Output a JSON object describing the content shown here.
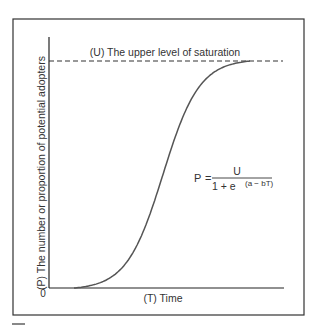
{
  "diagram": {
    "saturation_label": "(U) The upper level of saturation",
    "y_axis_label": "(P) The number or proportion of potential adopters",
    "x_axis_label": "(T) Time",
    "origin_label": "0",
    "formula": {
      "lhs": "P",
      "equals": "=",
      "numerator": "U",
      "denominator_base": "1 + e",
      "exponent": "(a − bT)"
    },
    "colors": {
      "curve": "#555555",
      "axis": "#222222",
      "frame": "#333333",
      "dashed": "#333333"
    }
  },
  "chart_data": {
    "type": "line",
    "title": "",
    "xlabel": "(T) Time",
    "ylabel": "(P) The number or proportion of potential adopters",
    "series": [
      {
        "name": "P = U / (1 + e^(a - bT))",
        "model": "logistic",
        "x": [
          0.0,
          0.1,
          0.2,
          0.3,
          0.4,
          0.5,
          0.6,
          0.7,
          0.8
        ],
        "y": [
          0.0,
          0.05,
          0.15,
          0.35,
          0.6,
          0.85,
          0.97,
          1.0,
          1.0
        ]
      }
    ],
    "reference_lines": [
      {
        "name": "U",
        "label": "(U) The upper level of saturation",
        "y": 1.0,
        "style": "dashed"
      }
    ],
    "xlim": [
      0,
      1
    ],
    "ylim": [
      0,
      1.1
    ],
    "grid": false
  }
}
